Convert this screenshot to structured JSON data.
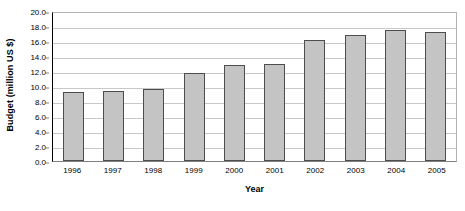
{
  "chart_data": {
    "type": "bar",
    "title": "",
    "subtitle": "",
    "xlabel": "Year",
    "ylabel": "Budget (million US $)",
    "categories": [
      "1996",
      "1997",
      "1998",
      "1999",
      "2000",
      "2001",
      "2002",
      "2003",
      "2004",
      "2005"
    ],
    "values": [
      9.2,
      9.4,
      9.6,
      11.8,
      12.8,
      13.0,
      16.2,
      16.8,
      17.5,
      17.2
    ],
    "series": [
      {
        "name": "Budget",
        "values": [
          9.2,
          9.4,
          9.6,
          11.8,
          12.8,
          13.0,
          16.2,
          16.8,
          17.5,
          17.2
        ]
      }
    ],
    "ylim": [
      0.0,
      20.0
    ],
    "ytick_step": 2.0,
    "ytick_labels": [
      "0.0",
      "2.0",
      "4.0",
      "6.0",
      "8.0",
      "10.0",
      "12.0",
      "14.0",
      "16.0",
      "18.0",
      "20.0"
    ],
    "ytick_values": [
      0.0,
      2.0,
      4.0,
      6.0,
      8.0,
      10.0,
      12.0,
      14.0,
      16.0,
      18.0,
      20.0
    ],
    "grid": true,
    "grid_axis": "y",
    "legend": false,
    "legend_position": "none",
    "bar_fill_color": "#c4c4c4",
    "bar_border_color": "#4d4d4d",
    "gridline_color": "#c8c8c8",
    "plot_border_color": "#b4b4b4",
    "axis_color": "#000000",
    "background_color": "#ffffff"
  }
}
